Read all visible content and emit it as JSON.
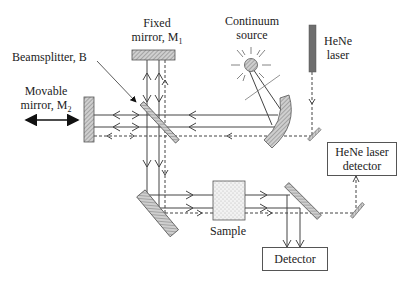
{
  "labels": {
    "fixed_mirror_line1": "Fixed",
    "fixed_mirror_line2": "mirror, M",
    "fixed_mirror_sub": "1",
    "continuum_line1": "Continuum",
    "continuum_line2": "source",
    "hene_line1": "HeNe",
    "hene_line2": "laser",
    "beamsplitter": "Beamsplitter, B",
    "movable_line1": "Movable",
    "movable_line2": "mirror, M",
    "movable_sub": "2",
    "hene_detector_line1": "HeNe laser",
    "hene_detector_line2": "detector",
    "sample": "Sample",
    "detector": "Detector"
  },
  "colors": {
    "line": "#444444",
    "mirror_fill": "#bbbbbb",
    "laser_fill": "#6e6e6e",
    "sample_fill": "#eeeeee"
  },
  "components": [
    {
      "name": "fixed-mirror-M1",
      "type": "mirror"
    },
    {
      "name": "movable-mirror-M2",
      "type": "mirror",
      "motion": "bidirectional horizontal"
    },
    {
      "name": "beamsplitter-B",
      "type": "beamsplitter"
    },
    {
      "name": "continuum-source",
      "type": "source"
    },
    {
      "name": "curved-mirror",
      "type": "collimating mirror"
    },
    {
      "name": "hene-laser",
      "type": "laser"
    },
    {
      "name": "sample",
      "type": "sample cell"
    },
    {
      "name": "detector",
      "type": "detector"
    },
    {
      "name": "hene-laser-detector",
      "type": "detector"
    }
  ]
}
